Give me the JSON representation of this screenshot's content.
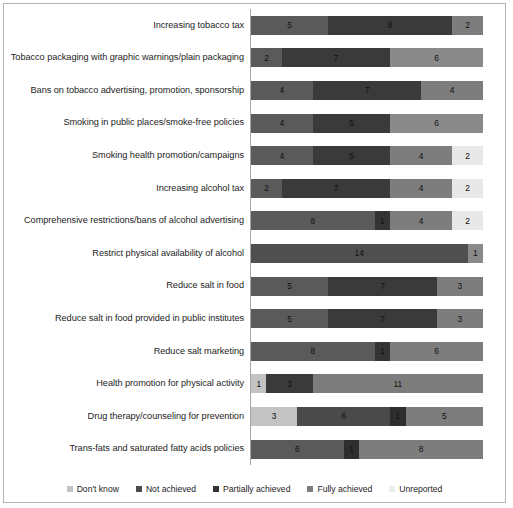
{
  "chart_data": {
    "type": "bar",
    "orientation": "horizontal",
    "stacked": true,
    "title": "",
    "xlabel": "",
    "ylabel": "",
    "xlim": [
      0,
      15
    ],
    "grid": false,
    "legend_position": "bottom",
    "categories": [
      "Increasing tobacco tax",
      "Tobacco packaging with graphic warnings/plain packaging",
      "Bans on tobacco advertising, promotion, sponsorship",
      "Smoking in public places/smoke-free policies",
      "Smoking health promotion/campaigns",
      "Increasing alcohol tax",
      "Comprehensive restrictions/bans of alcohol advertising",
      "Restrict physical availability of alcohol",
      "Reduce salt in food",
      "Reduce salt in food provided in public institutes",
      "Reduce salt marketing",
      "Health promotion for physical activity",
      "Drug therapy/counseling for prevention",
      "Trans-fats and saturated fatty acids policies"
    ],
    "series": [
      {
        "name": "Don't know",
        "color": "#c3c3c3",
        "values": [
          0,
          0,
          0,
          0,
          0,
          0,
          0,
          0,
          0,
          0,
          0,
          1,
          3,
          0
        ]
      },
      {
        "name": "Not achieved",
        "color": "#5a5a5a",
        "values": [
          5,
          2,
          4,
          4,
          4,
          2,
          8,
          14,
          5,
          5,
          8,
          0,
          0,
          6
        ]
      },
      {
        "name": "Partially achieved",
        "color": "#3a3a3a",
        "values": [
          8,
          7,
          7,
          5,
          5,
          7,
          1,
          0,
          7,
          7,
          1,
          3,
          6,
          1
        ]
      },
      {
        "name": "Fully achieved",
        "color": "#7d7d7d",
        "values": [
          2,
          6,
          4,
          6,
          4,
          4,
          4,
          1,
          3,
          3,
          6,
          11,
          1,
          8
        ]
      },
      {
        "name": "Unreported",
        "color": "#e8e8e8",
        "values": [
          0,
          0,
          0,
          0,
          2,
          2,
          2,
          0,
          0,
          0,
          0,
          0,
          5,
          0
        ]
      }
    ],
    "rows": [
      {
        "category": "Increasing tobacco tax",
        "segments": [
          {
            "series": "Not achieved",
            "value": 5,
            "label": "5",
            "color": "#5a5a5a"
          },
          {
            "series": "Partially achieved",
            "value": 8,
            "label": "8",
            "color": "#3a3a3a"
          },
          {
            "series": "Fully achieved",
            "value": 2,
            "label": "2",
            "color": "#7d7d7d"
          }
        ]
      },
      {
        "category": "Tobacco packaging with graphic warnings/plain packaging",
        "segments": [
          {
            "series": "Not achieved",
            "value": 2,
            "label": "2",
            "color": "#5a5a5a"
          },
          {
            "series": "Partially achieved",
            "value": 7,
            "label": "7",
            "color": "#3a3a3a"
          },
          {
            "series": "Fully achieved",
            "value": 6,
            "label": "6",
            "color": "#8a8a8a"
          }
        ]
      },
      {
        "category": "Bans on tobacco advertising, promotion, sponsorship",
        "segments": [
          {
            "series": "Not achieved",
            "value": 4,
            "label": "4",
            "color": "#5a5a5a"
          },
          {
            "series": "Partially achieved",
            "value": 7,
            "label": "7",
            "color": "#3a3a3a"
          },
          {
            "series": "Fully achieved",
            "value": 4,
            "label": "4",
            "color": "#7d7d7d"
          }
        ]
      },
      {
        "category": "Smoking in public places/smoke-free policies",
        "segments": [
          {
            "series": "Not achieved",
            "value": 4,
            "label": "4",
            "color": "#5a5a5a"
          },
          {
            "series": "Partially achieved",
            "value": 5,
            "label": "5",
            "color": "#3a3a3a"
          },
          {
            "series": "Fully achieved",
            "value": 6,
            "label": "6",
            "color": "#8a8a8a"
          }
        ]
      },
      {
        "category": "Smoking health promotion/campaigns",
        "segments": [
          {
            "series": "Not achieved",
            "value": 4,
            "label": "4",
            "color": "#5a5a5a"
          },
          {
            "series": "Partially achieved",
            "value": 5,
            "label": "5",
            "color": "#3a3a3a"
          },
          {
            "series": "Fully achieved",
            "value": 4,
            "label": "4",
            "color": "#7d7d7d"
          },
          {
            "series": "Unreported",
            "value": 2,
            "label": "2",
            "color": "#e8e8e8"
          }
        ]
      },
      {
        "category": "Increasing alcohol tax",
        "segments": [
          {
            "series": "Not achieved",
            "value": 2,
            "label": "2",
            "color": "#5a5a5a"
          },
          {
            "series": "Partially achieved",
            "value": 7,
            "label": "7",
            "color": "#3a3a3a"
          },
          {
            "series": "Fully achieved",
            "value": 4,
            "label": "4",
            "color": "#7d7d7d"
          },
          {
            "series": "Unreported",
            "value": 2,
            "label": "2",
            "color": "#e8e8e8"
          }
        ]
      },
      {
        "category": "Comprehensive restrictions/bans of alcohol advertising",
        "segments": [
          {
            "series": "Not achieved",
            "value": 8,
            "label": "8",
            "color": "#5a5a5a"
          },
          {
            "series": "Partially achieved",
            "value": 1,
            "label": "1",
            "color": "#343434"
          },
          {
            "series": "Fully achieved",
            "value": 4,
            "label": "4",
            "color": "#7d7d7d"
          },
          {
            "series": "Unreported",
            "value": 2,
            "label": "2",
            "color": "#e8e8e8"
          }
        ]
      },
      {
        "category": "Restrict physical availability of alcohol",
        "segments": [
          {
            "series": "Not achieved",
            "value": 14,
            "label": "14",
            "color": "#4f4f4f"
          },
          {
            "series": "Fully achieved",
            "value": 1,
            "label": "1",
            "color": "#8a8a8a"
          }
        ]
      },
      {
        "category": "Reduce salt in food",
        "segments": [
          {
            "series": "Not achieved",
            "value": 5,
            "label": "5",
            "color": "#5a5a5a"
          },
          {
            "series": "Partially achieved",
            "value": 7,
            "label": "7",
            "color": "#3a3a3a"
          },
          {
            "series": "Fully achieved",
            "value": 3,
            "label": "3",
            "color": "#7d7d7d"
          }
        ]
      },
      {
        "category": "Reduce salt in food provided in public institutes",
        "segments": [
          {
            "series": "Not achieved",
            "value": 5,
            "label": "5",
            "color": "#5a5a5a"
          },
          {
            "series": "Partially achieved",
            "value": 7,
            "label": "7",
            "color": "#3a3a3a"
          },
          {
            "series": "Fully achieved",
            "value": 3,
            "label": "3",
            "color": "#7d7d7d"
          }
        ]
      },
      {
        "category": "Reduce salt marketing",
        "segments": [
          {
            "series": "Not achieved",
            "value": 8,
            "label": "8",
            "color": "#5a5a5a"
          },
          {
            "series": "Partially achieved",
            "value": 1,
            "label": "1",
            "color": "#343434"
          },
          {
            "series": "Fully achieved",
            "value": 6,
            "label": "6",
            "color": "#7d7d7d"
          }
        ]
      },
      {
        "category": "Health promotion for physical activity",
        "segments": [
          {
            "series": "Don't know",
            "value": 1,
            "label": "1",
            "color": "#c3c3c3"
          },
          {
            "series": "Partially achieved",
            "value": 3,
            "label": "3",
            "color": "#3a3a3a"
          },
          {
            "series": "Fully achieved",
            "value": 11,
            "label": "11",
            "color": "#7d7d7d"
          }
        ]
      },
      {
        "category": "Drug therapy/counseling for prevention",
        "segments": [
          {
            "series": "Don't know",
            "value": 3,
            "label": "3",
            "color": "#c3c3c3"
          },
          {
            "series": "Partially achieved",
            "value": 6,
            "label": "6",
            "color": "#4a4a4a"
          },
          {
            "series": "Not achieved",
            "value": 1,
            "label": "1",
            "color": "#2e2e2e"
          },
          {
            "series": "Fully achieved",
            "value": 5,
            "label": "5",
            "color": "#7d7d7d"
          }
        ]
      },
      {
        "category": "Trans-fats and saturated fatty acids policies",
        "segments": [
          {
            "series": "Not achieved",
            "value": 6,
            "label": "6",
            "color": "#5a5a5a"
          },
          {
            "series": "Partially achieved",
            "value": 1,
            "label": "1",
            "color": "#2e2e2e"
          },
          {
            "series": "Fully achieved",
            "value": 8,
            "label": "8",
            "color": "#7d7d7d"
          }
        ]
      }
    ],
    "legend": [
      {
        "label": "Don't know",
        "color": "#c3c3c3"
      },
      {
        "label": "Not achieved",
        "color": "#4a4a4a"
      },
      {
        "label": "Partially achieved",
        "color": "#333333"
      },
      {
        "label": "Fully achieved",
        "color": "#7d7d7d"
      },
      {
        "label": "Unreported",
        "color": "#ececec"
      }
    ]
  }
}
